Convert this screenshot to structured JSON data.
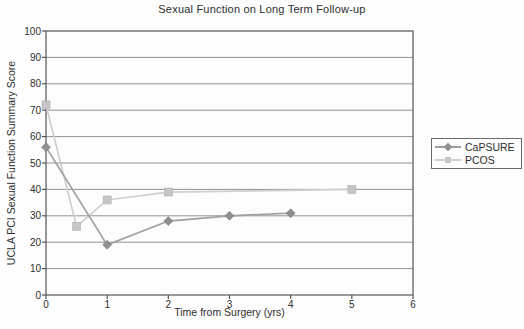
{
  "figure": {
    "background": "#fdfdfd"
  },
  "chart_data": {
    "type": "line",
    "title": "Sexual Function on Long Term Follow-up",
    "xlabel": "Time from Surgery (yrs)",
    "ylabel": "UCLA PCI Sexual Function Summary Score",
    "xlim": [
      0,
      6
    ],
    "ylim": [
      0,
      100
    ],
    "x_ticks": [
      0,
      1,
      2,
      3,
      4,
      5,
      6
    ],
    "y_ticks": [
      0,
      10,
      20,
      30,
      40,
      50,
      60,
      70,
      80,
      90,
      100
    ],
    "grid": "horizontal-only",
    "legend_position": "outside-right",
    "series": [
      {
        "name": "CaPSURE",
        "marker": "diamond",
        "line_color": "#a0a0a0",
        "marker_color": "#8f8f8f",
        "points": [
          [
            0,
            56
          ],
          [
            1,
            19
          ],
          [
            2,
            28
          ],
          [
            3,
            30
          ],
          [
            4,
            31
          ]
        ]
      },
      {
        "name": "PCOS",
        "marker": "square",
        "line_color": "#cfcfcf",
        "marker_color": "#c5c5c5",
        "points": [
          [
            0,
            72
          ],
          [
            0.5,
            26
          ],
          [
            1,
            36
          ],
          [
            2,
            39
          ],
          [
            5,
            40
          ]
        ]
      }
    ],
    "colors": {
      "grid": "#929292",
      "axis": "#555555",
      "text": "#2e2e2e",
      "legend_border": "#6a6a6a"
    }
  }
}
